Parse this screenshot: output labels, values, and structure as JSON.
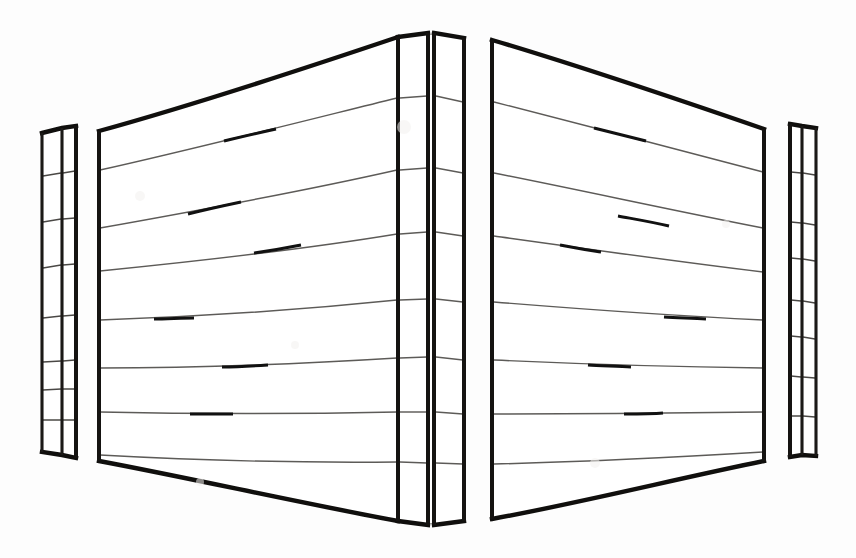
{
  "document": {
    "title": "Folded Panel Structure — Line Drawing",
    "kind": "technical-line-drawing",
    "background_color": "#fdfdfd",
    "ink_color": "#100f0d",
    "rail_color": "#5d5b58",
    "accent_color": "#111111",
    "canvas": {
      "width": 856,
      "height": 558
    },
    "visible_text": "",
    "label_count": 0
  },
  "geometry": {
    "apex_x": 431,
    "apex_top_y": 33,
    "apex_bottom_y": 525,
    "left_outer_x": 42,
    "right_outer_x": 816,
    "left_outer_top_y": 133,
    "left_outer_bottom_y": 452,
    "right_outer_top_y": 128,
    "right_outer_bottom_y": 456,
    "vertical_posts_x": [
      42,
      62,
      76,
      99,
      398,
      428,
      434,
      464,
      492,
      764,
      790,
      802,
      816
    ],
    "rail_count_per_panel": 7,
    "panel_count": 6,
    "description": "Symmetric chevron / tent-folded panel assembly seen in perspective. Two wide central panels meet at a vertical ridge at the horizontal centre; narrow return panels flank each far edge. Seven horizontal rails span every panel, sloping up toward the centre ridge."
  },
  "panels": [
    {
      "name": "far-left-return-panel",
      "left_x": 42,
      "right_x": 62,
      "top_left_y": 133,
      "top_right_y": 128,
      "bottom_left_y": 452,
      "bottom_right_y": 455,
      "rails": 7,
      "rail_style": "short-tick"
    },
    {
      "name": "left-return-panel",
      "left_x": 62,
      "right_x": 76,
      "top_left_y": 128,
      "top_right_y": 126,
      "bottom_left_y": 455,
      "bottom_right_y": 458,
      "rails": 7,
      "rail_style": "short-tick"
    },
    {
      "name": "left-main-panel",
      "left_x": 99,
      "right_x": 398,
      "top_left_y": 131,
      "top_right_y": 37,
      "bottom_left_y": 461,
      "bottom_right_y": 521,
      "rails": 7,
      "rail_style": "full-span"
    },
    {
      "name": "ridge-panel-left",
      "left_x": 398,
      "right_x": 428,
      "top_left_y": 37,
      "top_right_y": 33,
      "bottom_left_y": 521,
      "bottom_right_y": 525,
      "rails": 7,
      "rail_style": "full-span"
    },
    {
      "name": "ridge-panel-right",
      "left_x": 434,
      "right_x": 464,
      "top_left_y": 33,
      "top_right_y": 38,
      "bottom_left_y": 525,
      "bottom_right_y": 521,
      "rails": 7,
      "rail_style": "full-span"
    },
    {
      "name": "right-main-panel",
      "left_x": 492,
      "right_x": 764,
      "top_left_y": 40,
      "top_right_y": 129,
      "bottom_left_y": 519,
      "bottom_right_y": 461,
      "rails": 7,
      "rail_style": "full-span"
    },
    {
      "name": "right-return-panel",
      "left_x": 790,
      "right_x": 802,
      "top_left_y": 124,
      "top_right_y": 126,
      "bottom_left_y": 457,
      "bottom_right_y": 455,
      "rails": 7,
      "rail_style": "short-tick"
    },
    {
      "name": "far-right-return-panel",
      "left_x": 802,
      "right_x": 816,
      "top_left_y": 126,
      "top_right_y": 128,
      "bottom_left_y": 455,
      "bottom_right_y": 456,
      "rails": 7,
      "rail_style": "short-tick"
    }
  ],
  "rails": {
    "left_panel_y_at_left_edge": [
      170,
      228,
      271,
      320,
      368,
      412,
      455
    ],
    "left_panel_y_at_ridge": [
      98,
      170,
      234,
      300,
      358,
      412,
      462
    ],
    "right_panel_y_at_ridge": [
      102,
      173,
      236,
      302,
      360,
      414,
      464
    ],
    "right_panel_y_at_right_edge": [
      172,
      228,
      272,
      320,
      368,
      412,
      452
    ],
    "accent_segments_left_panel": [
      {
        "rail": 1,
        "x_start": 225,
        "x_end": 275
      },
      {
        "rail": 2,
        "x_start": 188,
        "x_end": 240
      },
      {
        "rail": 3,
        "x_start": 255,
        "x_end": 300
      },
      {
        "rail": 4,
        "x_start": 155,
        "x_end": 193
      },
      {
        "rail": 5,
        "x_start": 222,
        "x_end": 268
      },
      {
        "rail": 6,
        "x_start": 190,
        "x_end": 232
      }
    ],
    "accent_segments_right_panel": [
      {
        "rail": 1,
        "x_start": 595,
        "x_end": 645
      },
      {
        "rail": 2,
        "x_start": 618,
        "x_end": 668
      },
      {
        "rail": 3,
        "x_start": 562,
        "x_end": 600
      },
      {
        "rail": 4,
        "x_start": 665,
        "x_end": 705
      },
      {
        "rail": 5,
        "x_start": 588,
        "x_end": 630
      },
      {
        "rail": 6,
        "x_start": 625,
        "x_end": 662
      }
    ]
  },
  "stroke_widths": {
    "outer_outline": 4.4,
    "post": 4.0,
    "post_thin": 3.1,
    "rail": 1.45,
    "rail_accent": 2.9,
    "tick": 1.5
  }
}
